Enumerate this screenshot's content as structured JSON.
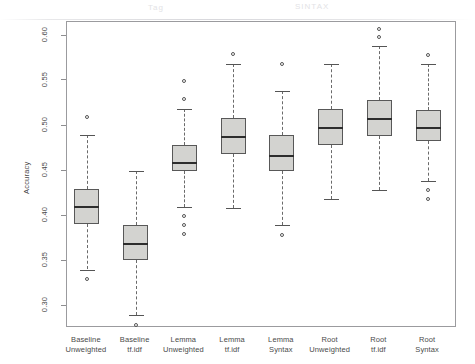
{
  "figure": {
    "ylabel": "Accuracy",
    "smudges": [
      {
        "text": "Tag",
        "left": 148,
        "top": 3
      },
      {
        "text": "SINTAX",
        "left": 295,
        "top": 2
      }
    ]
  },
  "chart_data": {
    "type": "box",
    "title": "",
    "xlabel": "",
    "ylabel": "Accuracy",
    "ylim": [
      0.275,
      0.615
    ],
    "yticks": [
      0.3,
      0.35,
      0.4,
      0.45,
      0.5,
      0.55,
      0.6
    ],
    "ytick_labels": [
      "0.30",
      "0.35",
      "0.40",
      "0.45",
      "0.50",
      "0.55",
      "0.60"
    ],
    "grid": false,
    "legend": null,
    "categories": [
      "Baseline Unweighted",
      "Baseline tf.idf",
      "Lemma Unweighted",
      "Lemma tf.idf",
      "Lemma Syntax",
      "Root Unweighted",
      "Root tf.idf",
      "Root Syntax"
    ],
    "category_lines": [
      [
        "Baseline",
        "Unweighted"
      ],
      [
        "Baseline",
        "tf.idf"
      ],
      [
        "Lemma",
        "Unweighted"
      ],
      [
        "Lemma",
        "tf.idf"
      ],
      [
        "Lemma",
        "Syntax"
      ],
      [
        "Root",
        "Unweighted"
      ],
      [
        "Root",
        "tf.idf"
      ],
      [
        "Root",
        "Syntax"
      ]
    ],
    "boxes": [
      {
        "category": "Baseline Unweighted",
        "whisker_low": 0.34,
        "q1": 0.391,
        "median": 0.411,
        "q3": 0.429,
        "whisker_high": 0.489,
        "outliers": [
          0.51,
          0.329
        ]
      },
      {
        "category": "Baseline tf.idf",
        "whisker_low": 0.289,
        "q1": 0.351,
        "median": 0.369,
        "q3": 0.389,
        "whisker_high": 0.449,
        "outliers": [
          0.278
        ]
      },
      {
        "category": "Lemma Unweighted",
        "whisker_low": 0.409,
        "q1": 0.449,
        "median": 0.459,
        "q3": 0.478,
        "whisker_high": 0.518,
        "outliers": [
          0.549,
          0.529,
          0.399,
          0.389,
          0.379
        ]
      },
      {
        "category": "Lemma tf.idf",
        "whisker_low": 0.408,
        "q1": 0.468,
        "median": 0.488,
        "q3": 0.508,
        "whisker_high": 0.568,
        "outliers": [
          0.579
        ]
      },
      {
        "category": "Lemma Syntax",
        "whisker_low": 0.389,
        "q1": 0.449,
        "median": 0.467,
        "q3": 0.489,
        "whisker_high": 0.538,
        "outliers": [
          0.568,
          0.378
        ]
      },
      {
        "category": "Root Unweighted",
        "whisker_low": 0.418,
        "q1": 0.478,
        "median": 0.498,
        "q3": 0.518,
        "whisker_high": 0.568,
        "outliers": []
      },
      {
        "category": "Root tf.idf",
        "whisker_low": 0.428,
        "q1": 0.488,
        "median": 0.508,
        "q3": 0.528,
        "whisker_high": 0.588,
        "outliers": [
          0.607,
          0.598
        ]
      },
      {
        "category": "Root Syntax",
        "whisker_low": 0.438,
        "q1": 0.483,
        "median": 0.498,
        "q3": 0.517,
        "whisker_high": 0.568,
        "outliers": [
          0.578,
          0.428,
          0.418
        ]
      }
    ],
    "colors": {
      "box_fill": "#d3d3d0",
      "box_border": "#585858",
      "median": "#2d2d2d",
      "whisker": "#6a6a6a",
      "axis": "#9b9b9e",
      "text": "#4a4a4a"
    }
  }
}
